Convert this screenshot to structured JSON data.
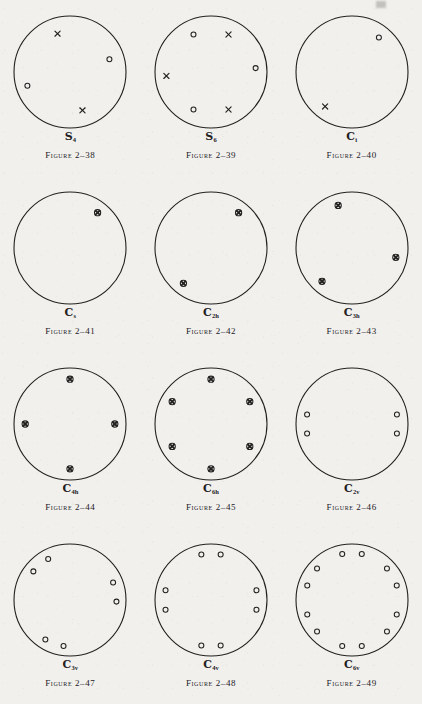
{
  "page": {
    "background_color": "#f1f0ed",
    "ink_color": "#23211f",
    "circle_radius": 56,
    "point_radius_frac": 0.8
  },
  "legend": {
    "open_circle": "point above projection plane",
    "cross": "point below projection plane",
    "circled_cross": "coincident points above and below plane"
  },
  "figures": [
    {
      "id": "fig-2-38",
      "symbol_base": "S",
      "symbol_sub": "4",
      "caption": "Figure 2–38",
      "point_count": 4,
      "points": [
        {
          "angle_deg": 108,
          "r_frac": 0.72,
          "type": "cross"
        },
        {
          "angle_deg": 18,
          "r_frac": 0.74,
          "type": "circle"
        },
        {
          "angle_deg": 198,
          "r_frac": 0.8,
          "type": "circle"
        },
        {
          "angle_deg": 288,
          "r_frac": 0.72,
          "type": "cross"
        }
      ]
    },
    {
      "id": "fig-2-39",
      "symbol_base": "S",
      "symbol_sub": "6",
      "caption": "Figure 2–39",
      "point_count": 6,
      "points": [
        {
          "angle_deg": 115,
          "r_frac": 0.74,
          "type": "circle"
        },
        {
          "angle_deg": 65,
          "r_frac": 0.74,
          "type": "cross"
        },
        {
          "angle_deg": 5,
          "r_frac": 0.8,
          "type": "circle"
        },
        {
          "angle_deg": 295,
          "r_frac": 0.74,
          "type": "cross"
        },
        {
          "angle_deg": 245,
          "r_frac": 0.74,
          "type": "circle"
        },
        {
          "angle_deg": 185,
          "r_frac": 0.8,
          "type": "cross"
        }
      ]
    },
    {
      "id": "fig-2-40",
      "symbol_base": "C",
      "symbol_sub": "i",
      "caption": "Figure 2–40",
      "point_count": 2,
      "points": [
        {
          "angle_deg": 52,
          "r_frac": 0.78,
          "type": "circle"
        },
        {
          "angle_deg": 232,
          "r_frac": 0.78,
          "type": "cross"
        }
      ]
    },
    {
      "id": "fig-2-41",
      "symbol_base": "C",
      "symbol_sub": "s",
      "caption": "Figure 2–41",
      "point_count": 1,
      "points": [
        {
          "angle_deg": 52,
          "r_frac": 0.8,
          "type": "circled-cross"
        }
      ]
    },
    {
      "id": "fig-2-42",
      "symbol_base": "C",
      "symbol_sub": "2h",
      "caption": "Figure 2–42",
      "point_count": 2,
      "points": [
        {
          "angle_deg": 52,
          "r_frac": 0.8,
          "type": "circled-cross"
        },
        {
          "angle_deg": 232,
          "r_frac": 0.8,
          "type": "circled-cross"
        }
      ]
    },
    {
      "id": "fig-2-43",
      "symbol_base": "C",
      "symbol_sub": "3h",
      "caption": "Figure 2–43",
      "point_count": 3,
      "points": [
        {
          "angle_deg": 108,
          "r_frac": 0.8,
          "type": "circled-cross"
        },
        {
          "angle_deg": 348,
          "r_frac": 0.8,
          "type": "circled-cross"
        },
        {
          "angle_deg": 228,
          "r_frac": 0.8,
          "type": "circled-cross"
        }
      ]
    },
    {
      "id": "fig-2-44",
      "symbol_base": "C",
      "symbol_sub": "4h",
      "caption": "Figure 2–44",
      "point_count": 4,
      "points": [
        {
          "angle_deg": 90,
          "r_frac": 0.8,
          "type": "circled-cross"
        },
        {
          "angle_deg": 0,
          "r_frac": 0.8,
          "type": "circled-cross"
        },
        {
          "angle_deg": 180,
          "r_frac": 0.8,
          "type": "circled-cross"
        },
        {
          "angle_deg": 270,
          "r_frac": 0.8,
          "type": "circled-cross"
        }
      ]
    },
    {
      "id": "fig-2-45",
      "symbol_base": "C",
      "symbol_sub": "6h",
      "caption": "Figure 2–45",
      "point_count": 6,
      "points": [
        {
          "angle_deg": 90,
          "r_frac": 0.8,
          "type": "circled-cross"
        },
        {
          "angle_deg": 30,
          "r_frac": 0.8,
          "type": "circled-cross"
        },
        {
          "angle_deg": 330,
          "r_frac": 0.8,
          "type": "circled-cross"
        },
        {
          "angle_deg": 270,
          "r_frac": 0.8,
          "type": "circled-cross"
        },
        {
          "angle_deg": 210,
          "r_frac": 0.8,
          "type": "circled-cross"
        },
        {
          "angle_deg": 150,
          "r_frac": 0.8,
          "type": "circled-cross"
        }
      ]
    },
    {
      "id": "fig-2-46",
      "symbol_base": "C",
      "symbol_sub": "2v",
      "caption": "Figure 2–46",
      "point_count": 4,
      "points": [
        {
          "angle_deg": 168,
          "r_frac": 0.82,
          "type": "circle"
        },
        {
          "angle_deg": 192,
          "r_frac": 0.82,
          "type": "circle"
        },
        {
          "angle_deg": 12,
          "r_frac": 0.82,
          "type": "circle"
        },
        {
          "angle_deg": 348,
          "r_frac": 0.82,
          "type": "circle"
        }
      ]
    },
    {
      "id": "fig-2-47",
      "symbol_base": "C",
      "symbol_sub": "3v",
      "caption": "Figure 2–47",
      "point_count": 6,
      "points": [
        {
          "angle_deg": 118,
          "r_frac": 0.83,
          "type": "circle"
        },
        {
          "angle_deg": 142,
          "r_frac": 0.83,
          "type": "circle"
        },
        {
          "angle_deg": 358,
          "r_frac": 0.83,
          "type": "circle"
        },
        {
          "angle_deg": 22,
          "r_frac": 0.83,
          "type": "circle"
        },
        {
          "angle_deg": 238,
          "r_frac": 0.83,
          "type": "circle"
        },
        {
          "angle_deg": 262,
          "r_frac": 0.83,
          "type": "circle"
        }
      ]
    },
    {
      "id": "fig-2-48",
      "symbol_base": "C",
      "symbol_sub": "4v",
      "caption": "Figure 2–48",
      "point_count": 8,
      "points": [
        {
          "angle_deg": 78,
          "r_frac": 0.83,
          "type": "circle"
        },
        {
          "angle_deg": 102,
          "r_frac": 0.83,
          "type": "circle"
        },
        {
          "angle_deg": 168,
          "r_frac": 0.83,
          "type": "circle"
        },
        {
          "angle_deg": 192,
          "r_frac": 0.83,
          "type": "circle"
        },
        {
          "angle_deg": 258,
          "r_frac": 0.83,
          "type": "circle"
        },
        {
          "angle_deg": 282,
          "r_frac": 0.83,
          "type": "circle"
        },
        {
          "angle_deg": 348,
          "r_frac": 0.83,
          "type": "circle"
        },
        {
          "angle_deg": 12,
          "r_frac": 0.83,
          "type": "circle"
        }
      ]
    },
    {
      "id": "fig-2-49",
      "symbol_base": "C",
      "symbol_sub": "6v",
      "caption": "Figure 2–49",
      "point_count": 12,
      "points": [
        {
          "angle_deg": 78,
          "r_frac": 0.84,
          "type": "circle"
        },
        {
          "angle_deg": 102,
          "r_frac": 0.84,
          "type": "circle"
        },
        {
          "angle_deg": 138,
          "r_frac": 0.84,
          "type": "circle"
        },
        {
          "angle_deg": 162,
          "r_frac": 0.84,
          "type": "circle"
        },
        {
          "angle_deg": 198,
          "r_frac": 0.84,
          "type": "circle"
        },
        {
          "angle_deg": 222,
          "r_frac": 0.84,
          "type": "circle"
        },
        {
          "angle_deg": 258,
          "r_frac": 0.84,
          "type": "circle"
        },
        {
          "angle_deg": 282,
          "r_frac": 0.84,
          "type": "circle"
        },
        {
          "angle_deg": 318,
          "r_frac": 0.84,
          "type": "circle"
        },
        {
          "angle_deg": 342,
          "r_frac": 0.84,
          "type": "circle"
        },
        {
          "angle_deg": 18,
          "r_frac": 0.84,
          "type": "circle"
        },
        {
          "angle_deg": 42,
          "r_frac": 0.84,
          "type": "circle"
        }
      ]
    }
  ]
}
